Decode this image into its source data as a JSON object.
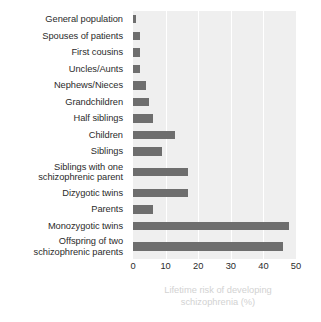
{
  "chart_data": {
    "type": "bar",
    "orientation": "horizontal",
    "title": "",
    "xlabel": "Lifetime risk of developing\nschizophrenia (%)",
    "ylabel": "",
    "xlim": [
      0,
      50
    ],
    "xticks": [
      0,
      10,
      20,
      30,
      40,
      50
    ],
    "grid": true,
    "legend": null,
    "bar_color": "#6e6e6e",
    "plot_background": "#efefef",
    "categories": [
      "General population",
      "Spouses of patients",
      "First cousins",
      "Uncles/Aunts",
      "Nephews/Nieces",
      "Grandchildren",
      "Half siblings",
      "Children",
      "Siblings",
      "Siblings with one\nschizophrenic parent",
      "Dizygotic twins",
      "Parents",
      "Monozygotic twins",
      "Offspring of two\nschizophrenic parents"
    ],
    "values": [
      1,
      2,
      2,
      2,
      4,
      5,
      6,
      13,
      9,
      17,
      17,
      6,
      48,
      46
    ]
  }
}
